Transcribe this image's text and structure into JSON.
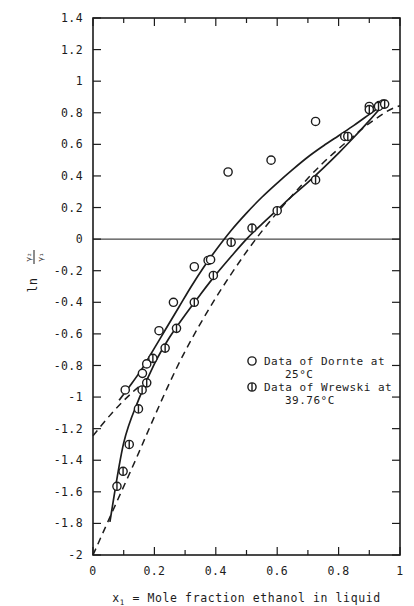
{
  "figure": {
    "background": "#ffffff",
    "ink": "#1c1c1c"
  },
  "axes": {
    "x": {
      "label_prefix": "x",
      "label_sub": "1",
      "label_text": " = Mole fraction ethanol in liquid",
      "full_label": "x1 = Mole fraction ethanol in liquid",
      "min": 0,
      "max": 1,
      "major_ticks": [
        0,
        0.2,
        0.4,
        0.6,
        0.8,
        1
      ],
      "major_tick_labels": [
        "0",
        "0.2",
        "0.4",
        "0.6",
        "0.8",
        "1"
      ],
      "minor_tick_step": 0.1
    },
    "y": {
      "label_ln": "ln",
      "label_numerator": "γ₂",
      "label_denominator": "γ₁",
      "full_label": "ln γ₂/γ₁",
      "min": -2,
      "max": 1.4,
      "major_ticks": [
        1.4,
        1.2,
        1,
        0.8,
        0.6,
        0.4,
        0.2,
        0,
        -0.2,
        -0.4,
        -0.6,
        -0.8,
        -1,
        -1.2,
        -1.4,
        -1.6,
        -1.8,
        -2
      ],
      "major_tick_labels": [
        "1.4",
        "1.2",
        "1",
        "0.8",
        "0.6",
        "0.4",
        "0.2",
        "0",
        "-0.2",
        "-0.4",
        "-0.6",
        "-0.8",
        "-1",
        "-1.2",
        "-1.4",
        "-1.6",
        "-1.8",
        "-2"
      ],
      "zero_line": 0
    },
    "frame": {
      "left": 0,
      "right": 1,
      "bottom": -2,
      "top": 1.4
    }
  },
  "legend": {
    "position": "center-right",
    "entries": [
      {
        "marker": "open-circle",
        "line1": "Data of Dornte at",
        "line2": "25°C"
      },
      {
        "marker": "circle-with-bar",
        "line1": "Data of Wrewski at",
        "line2": "39.76°C"
      }
    ]
  },
  "chart_data": {
    "type": "scatter",
    "title": "",
    "xlabel": "x1 = Mole fraction ethanol in liquid",
    "ylabel": "ln γ₂/γ₁",
    "xlim": [
      0,
      1
    ],
    "ylim": [
      -2,
      1.4
    ],
    "grid": false,
    "legend_position": "center-right",
    "series": [
      {
        "name": "Data of Dornte at 25°C",
        "marker": "open-circle",
        "x": [
          0.105,
          0.161,
          0.175,
          0.215,
          0.262,
          0.33,
          0.375,
          0.383,
          0.44,
          0.58,
          0.725,
          0.82,
          0.9,
          0.932,
          0.945
        ],
        "y": [
          -0.955,
          -0.85,
          -0.79,
          -0.58,
          -0.4,
          -0.175,
          -0.135,
          -0.13,
          0.425,
          0.5,
          0.745,
          0.65,
          0.84,
          0.845,
          0.855
        ]
      },
      {
        "name": "Data of Wrewski at 39.76°C",
        "marker": "circle-with-bar",
        "x": [
          0.078,
          0.098,
          0.118,
          0.148,
          0.16,
          0.175,
          0.195,
          0.235,
          0.272,
          0.33,
          0.392,
          0.45,
          0.518,
          0.6,
          0.725,
          0.83,
          0.9,
          0.93,
          0.95
        ],
        "y": [
          -1.565,
          -1.47,
          -1.3,
          -1.075,
          -0.955,
          -0.91,
          -0.755,
          -0.69,
          -0.565,
          -0.4,
          -0.23,
          -0.02,
          0.07,
          0.18,
          0.375,
          0.65,
          0.82,
          0.84,
          0.855
        ]
      }
    ],
    "curves": [
      {
        "name": "dornte-curve",
        "style": "solid",
        "points_x": [
          0.085,
          0.12,
          0.16,
          0.2,
          0.24,
          0.28,
          0.32,
          0.36,
          0.4,
          0.45,
          0.5,
          0.55,
          0.6,
          0.65,
          0.7,
          0.75,
          0.8,
          0.85,
          0.9,
          0.95
        ],
        "points_y": [
          -1.02,
          -0.93,
          -0.82,
          -0.69,
          -0.56,
          -0.43,
          -0.3,
          -0.18,
          -0.07,
          0.055,
          0.165,
          0.265,
          0.355,
          0.44,
          0.52,
          0.59,
          0.655,
          0.72,
          0.79,
          0.86
        ]
      },
      {
        "name": "wrewski-curve",
        "style": "solid",
        "points_x": [
          0.055,
          0.1,
          0.15,
          0.2,
          0.25,
          0.3,
          0.35,
          0.4,
          0.45,
          0.5,
          0.55,
          0.6,
          0.65,
          0.7,
          0.75,
          0.8,
          0.85,
          0.9,
          0.95
        ],
        "points_y": [
          -1.79,
          -1.29,
          -1.01,
          -0.79,
          -0.62,
          -0.48,
          -0.35,
          -0.225,
          -0.11,
          0.0,
          0.095,
          0.185,
          0.275,
          0.36,
          0.45,
          0.545,
          0.645,
          0.75,
          0.86
        ]
      },
      {
        "name": "dashed-extrapolation",
        "style": "dashed",
        "points_x": [
          0.0,
          0.12,
          0.3,
          0.5,
          0.7,
          0.85,
          0.95,
          1.0
        ],
        "points_y": [
          -2.0,
          -1.48,
          -0.71,
          -0.08,
          0.385,
          0.655,
          0.8,
          0.845
        ]
      },
      {
        "name": "dashed-upper-left",
        "style": "dashed",
        "points_x": [
          0.0,
          0.06,
          0.12,
          0.18
        ],
        "points_y": [
          -1.245,
          -1.105,
          -0.985,
          -0.885
        ]
      }
    ]
  }
}
